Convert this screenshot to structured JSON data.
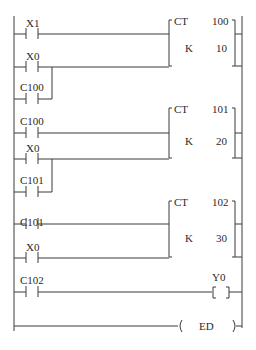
{
  "diagram": {
    "type": "ladder-logic",
    "rungs": [
      {
        "inputs": [
          {
            "label": "X1",
            "type": "NO-contact"
          },
          {
            "label": "X0",
            "type": "NO-contact"
          },
          {
            "label": "C100",
            "type": "NO-contact",
            "parallel_with": "X0"
          }
        ],
        "output": {
          "instruction": "CT",
          "number": "100",
          "k_label": "K",
          "k_value": "10"
        }
      },
      {
        "inputs": [
          {
            "label": "C100",
            "type": "NO-contact"
          },
          {
            "label": "X0",
            "type": "NO-contact"
          },
          {
            "label": "C101",
            "type": "NO-contact",
            "parallel_with": "X0"
          }
        ],
        "output": {
          "instruction": "CT",
          "number": "101",
          "k_label": "K",
          "k_value": "20"
        }
      },
      {
        "inputs": [
          {
            "label": "C101",
            "type": "NO-contact"
          },
          {
            "label": "X0",
            "type": "NO-contact"
          }
        ],
        "output": {
          "instruction": "CT",
          "number": "102",
          "k_label": "K",
          "k_value": "30"
        }
      },
      {
        "inputs": [
          {
            "label": "C102",
            "type": "NO-contact"
          }
        ],
        "output": {
          "label": "Y0",
          "type": "coil",
          "symbol_left": "[",
          "symbol_right": "]"
        }
      },
      {
        "inputs": [],
        "output": {
          "label": "ED",
          "type": "end",
          "symbol_left": "(",
          "symbol_right": ")"
        }
      }
    ]
  }
}
